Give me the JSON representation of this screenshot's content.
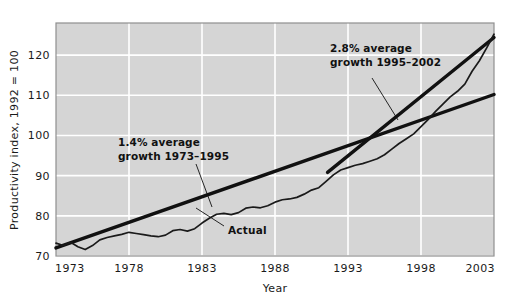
{
  "chart_data": {
    "type": "line",
    "title": "",
    "xlabel": "Year",
    "ylabel": "Productivity index, 1992 = 100",
    "xlim": [
      1973,
      2003
    ],
    "ylim": [
      70,
      128
    ],
    "grid": true,
    "legend": "none",
    "xticks": [
      "1973",
      "1978",
      "1983",
      "1988",
      "1993",
      "1998",
      "2003"
    ],
    "xtick_values": [
      1973,
      1978,
      1983,
      1988,
      1993,
      1998,
      2003
    ],
    "yticks": [
      "70",
      "80",
      "90",
      "100",
      "110",
      "120"
    ],
    "ytick_values": [
      70,
      80,
      90,
      100,
      110,
      120
    ],
    "series": [
      {
        "name": "Actual",
        "style": "thin-jagged",
        "x": [
          1973,
          1973.5,
          1974,
          1974.5,
          1975,
          1975.5,
          1976,
          1976.5,
          1977,
          1977.5,
          1978,
          1978.5,
          1979,
          1979.5,
          1980,
          1980.5,
          1981,
          1981.5,
          1982,
          1982.5,
          1983,
          1983.5,
          1984,
          1984.5,
          1985,
          1985.5,
          1986,
          1986.5,
          1987,
          1987.5,
          1988,
          1988.5,
          1989,
          1989.5,
          1990,
          1990.5,
          1991,
          1991.5,
          1992,
          1992.5,
          1993,
          1993.5,
          1994,
          1994.5,
          1995,
          1995.5,
          1996,
          1996.5,
          1997,
          1997.5,
          1998,
          1998.5,
          1999,
          1999.5,
          2000,
          2000.5,
          2001,
          2001.5,
          2002,
          2002.5,
          2003
        ],
        "y": [
          73.2,
          72.6,
          73.4,
          72.3,
          71.6,
          72.6,
          74.0,
          74.6,
          75.0,
          75.4,
          75.9,
          75.6,
          75.3,
          75.0,
          74.8,
          75.2,
          76.3,
          76.6,
          76.2,
          76.8,
          78.2,
          79.4,
          80.4,
          80.6,
          80.3,
          80.8,
          81.9,
          82.2,
          82.0,
          82.5,
          83.4,
          84.0,
          84.2,
          84.6,
          85.4,
          86.4,
          87.0,
          88.6,
          90.2,
          91.4,
          92.0,
          92.6,
          93.0,
          93.6,
          94.2,
          95.2,
          96.6,
          98.0,
          99.2,
          100.4,
          102.2,
          104.0,
          106.0,
          107.8,
          109.6,
          111.0,
          112.8,
          116.0,
          118.6,
          121.8,
          125.2
        ]
      },
      {
        "name": "1.4% average growth 1973-1995 trend",
        "style": "thick-straight",
        "x": [
          1973,
          2003
        ],
        "y": [
          72.0,
          110.2
        ]
      },
      {
        "name": "2.8% average growth 1995-2002 trend",
        "style": "thick-straight",
        "x": [
          1991.6,
          2003
        ],
        "y": [
          90.8,
          124.4
        ]
      }
    ],
    "annotations": [
      {
        "name": "growth-1973-1995",
        "line1": "1.4% average",
        "line2": "growth 1973–1995",
        "text_x": 118,
        "text_y": 146,
        "leader": [
          196,
          164,
          212,
          207
        ]
      },
      {
        "name": "growth-1995-2002",
        "line1": "2.8% average",
        "line2": "growth 1995–2002",
        "text_x": 330,
        "text_y": 52,
        "leader": [
          372,
          78,
          398,
          120
        ]
      },
      {
        "name": "actual-callout",
        "line1": "Actual",
        "text_x": 228,
        "text_y": 230,
        "leader": [
          224,
          226,
          196,
          208
        ]
      }
    ],
    "colors": {
      "plot_background": "#d5d5d5",
      "grid": "#ffffff",
      "series_line": "#1a1a1a",
      "trend_line": "#111111",
      "axis_text": "#1a1a1a",
      "page_background": "#ffffff",
      "plot_border": "#8f8f8f"
    }
  }
}
